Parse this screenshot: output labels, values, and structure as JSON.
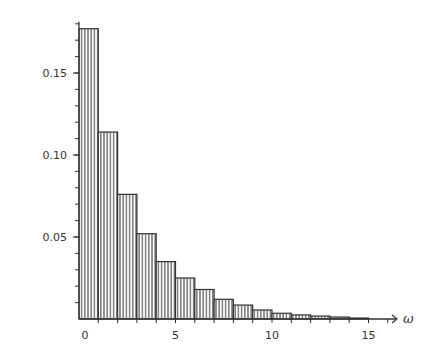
{
  "chart_data": {
    "type": "bar",
    "title": "",
    "xlabel": "ω",
    "ylabel": "",
    "x_bin_edges": [
      0,
      1,
      2,
      3,
      4,
      5,
      6,
      7,
      8,
      9,
      10,
      11,
      12,
      13,
      14,
      15
    ],
    "categories": [
      "0-1",
      "1-2",
      "2-3",
      "3-4",
      "4-5",
      "5-6",
      "6-7",
      "7-8",
      "8-9",
      "9-10",
      "10-11",
      "11-12",
      "12-13",
      "13-14",
      "14-15"
    ],
    "values": [
      0.177,
      0.114,
      0.076,
      0.052,
      0.035,
      0.025,
      0.018,
      0.012,
      0.0085,
      0.0055,
      0.0035,
      0.0025,
      0.0018,
      0.0012,
      0.0006
    ],
    "xlim": [
      0,
      16
    ],
    "ylim": [
      0,
      0.18
    ],
    "x_ticks": [
      0,
      5,
      10,
      15
    ],
    "x_tick_labels": [
      "0",
      "5",
      "10",
      "15"
    ],
    "x_minor_ticks_step": 1,
    "y_ticks": [
      0.05,
      0.1,
      0.15
    ],
    "y_tick_labels": [
      "0.05",
      "0.10",
      "0.15"
    ],
    "y_minor_ticks_step": 0.01,
    "grid": false,
    "legend": null,
    "bar_fill": "vertical-hatch",
    "colors": {
      "line": "#333333",
      "background": "#ffffff"
    }
  }
}
